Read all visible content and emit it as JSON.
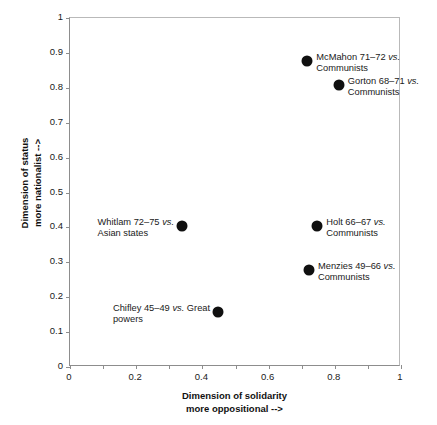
{
  "chart_data": {
    "type": "scatter",
    "title": "",
    "xlabel": "Dimension of solidarity\nmore oppositional -->",
    "ylabel": "Dimension of status\nmore nationalist -->",
    "xlabel_line1": "Dimension of solidarity",
    "xlabel_line2": "more oppositional -->",
    "ylabel_line1": "Dimension of status",
    "ylabel_line2": "more nationalist -->",
    "xlim": [
      0,
      1
    ],
    "ylim": [
      0,
      1
    ],
    "grid": false,
    "legend": "none",
    "xticks": [
      "0",
      "0.2",
      "0.4",
      "0.6",
      "0.8",
      "1"
    ],
    "xtick_values": [
      0,
      0.2,
      0.4,
      0.6,
      0.8,
      1
    ],
    "xtick_minor_step": 0.1,
    "yticks": [
      "0",
      "0.1",
      "0.2",
      "0.3",
      "0.4",
      "0.5",
      "0.6",
      "0.7",
      "0.8",
      "0.9",
      "1"
    ],
    "ytick_values": [
      0,
      0.1,
      0.2,
      0.3,
      0.4,
      0.5,
      0.6,
      0.7,
      0.8,
      0.9,
      1
    ],
    "marker_color": "#101010",
    "points": [
      {
        "label": "McMahon 71-72 vs.\nCommunists",
        "label_line1_pre": "McMahon 71–72 ",
        "label_line1_em": "vs.",
        "label_line2": "Communists",
        "x": 0.72,
        "y": 0.875,
        "label_side": "right"
      },
      {
        "label": "Gorton 68-71 vs.\nCommunists",
        "label_line1_pre": "Gorton 68–71 ",
        "label_line1_em": "vs.",
        "label_line2": "Communists",
        "x": 0.815,
        "y": 0.805,
        "label_side": "right"
      },
      {
        "label": "Whitlam 72-75 vs.\nAsian states",
        "label_line1_pre": "Whitlam 72–75 ",
        "label_line1_em": "vs.",
        "label_line2": "Asian states",
        "x": 0.34,
        "y": 0.4,
        "label_side": "left"
      },
      {
        "label": "Holt 66-67 vs.\nCommunists",
        "label_line1_pre": "Holt 66–67 ",
        "label_line1_em": "vs.",
        "label_line2": "Communists",
        "x": 0.75,
        "y": 0.4,
        "label_side": "right"
      },
      {
        "label": "Menzies 49-66 vs.\nCommunists",
        "label_line1_pre": "Menzies 49–66 ",
        "label_line1_em": "vs.",
        "label_line2": "Communists",
        "x": 0.725,
        "y": 0.275,
        "label_side": "right"
      },
      {
        "label": "Chifley 45-49 vs. Great\npowers",
        "label_line1_pre": "Chifley 45–49 ",
        "label_line1_em": "vs.",
        "label_line1_post": " Great",
        "label_line2": "powers",
        "x": 0.45,
        "y": 0.155,
        "label_side": "left"
      }
    ]
  }
}
